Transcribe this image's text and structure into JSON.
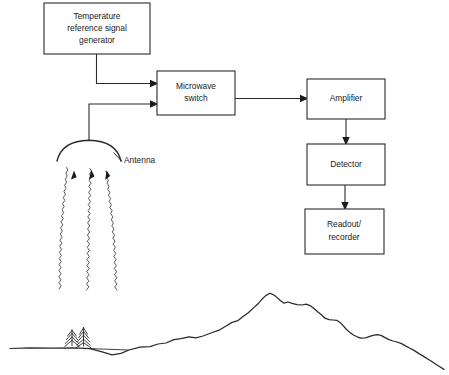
{
  "diagram": {
    "stroke_color": "#2a2a2a",
    "background_color": "#ffffff",
    "boxes": [
      {
        "id": "temperature-reference-signal-generator",
        "lines": [
          "Temperature",
          "reference signal",
          "generator"
        ],
        "x": 44,
        "y": 3,
        "w": 106,
        "h": 51
      },
      {
        "id": "microwave-switch",
        "lines": [
          "Microwave",
          "switch"
        ],
        "x": 157,
        "y": 71,
        "w": 78,
        "h": 44
      },
      {
        "id": "amplifier",
        "lines": [
          "Amplifier"
        ],
        "x": 307,
        "y": 79,
        "w": 78,
        "h": 40
      },
      {
        "id": "detector",
        "lines": [
          "Detector"
        ],
        "x": 307,
        "y": 144,
        "w": 78,
        "h": 41
      },
      {
        "id": "readout-recorder",
        "lines": [
          "Readout/",
          "recorder"
        ],
        "x": 305,
        "y": 209,
        "w": 79,
        "h": 45
      }
    ],
    "labels": [
      {
        "id": "antenna-label",
        "text": "Antenna",
        "x": 124,
        "y": 161
      }
    ],
    "scene": {
      "antenna_name": "antenna-dish",
      "ray_count": 3,
      "tree_count": 2,
      "terrain_name": "mountain-skyline"
    }
  }
}
